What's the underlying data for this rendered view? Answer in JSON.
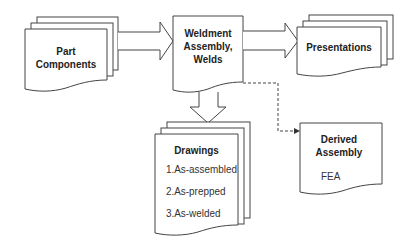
{
  "diagram": {
    "nodes": {
      "part_components": {
        "title": "Part Components",
        "line1": "Part",
        "line2": "Components",
        "shape": "stacked-documents"
      },
      "weldment": {
        "title": "Weldment Assembly, Welds",
        "line1": "Weldment",
        "line2": "Assembly,",
        "line3": "Welds",
        "shape": "document"
      },
      "presentations": {
        "title": "Presentations",
        "shape": "stacked-documents"
      },
      "drawings": {
        "title": "Drawings",
        "shape": "stacked-documents",
        "items": [
          "1.As-assembled",
          "2.As-prepped",
          "3.As-welded"
        ]
      },
      "derived": {
        "title": "Derived Assembly",
        "line1": "Derived",
        "line2": "Assembly",
        "sub": "FEA",
        "shape": "document"
      }
    },
    "edges": [
      {
        "from": "Part Components",
        "to": "Weldment Assembly, Welds",
        "style": "block-arrow"
      },
      {
        "from": "Weldment Assembly, Welds",
        "to": "Presentations",
        "style": "block-arrow"
      },
      {
        "from": "Weldment Assembly, Welds",
        "to": "Drawings",
        "style": "block-arrow"
      },
      {
        "from": "Weldment Assembly, Welds",
        "to": "Derived Assembly",
        "style": "dashed"
      }
    ],
    "colors": {
      "stroke": "#333333",
      "fill": "#ffffff",
      "text": "#222222"
    }
  }
}
